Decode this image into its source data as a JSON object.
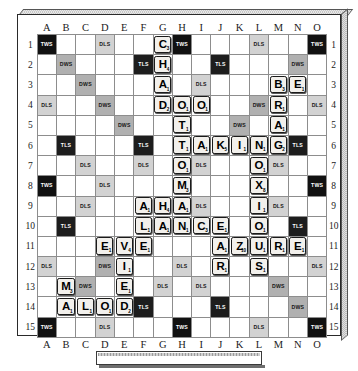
{
  "game": {
    "name": "Scrabble",
    "board_size": 15,
    "column_labels": [
      "A",
      "B",
      "C",
      "D",
      "E",
      "F",
      "G",
      "H",
      "I",
      "J",
      "K",
      "L",
      "M",
      "N",
      "O"
    ],
    "row_labels": [
      "1",
      "2",
      "3",
      "4",
      "5",
      "6",
      "7",
      "8",
      "9",
      "10",
      "11",
      "12",
      "13",
      "14",
      "15"
    ],
    "premium_legend": {
      "tws": "TWS",
      "dws": "DWS",
      "tls": "TLS",
      "dls": "DLS"
    },
    "colors": {
      "triple_word": "#111111",
      "double_word": "#b0b0b0",
      "triple_letter": "#1d1d1d",
      "double_letter": "#d2d2d2",
      "tile_face": "#f2f0ec",
      "board_background": "#ffffff",
      "grid_line": "#8d8d8d"
    }
  },
  "rack": {
    "tiles": [],
    "label": ""
  },
  "premium_squares": [
    {
      "col": "A",
      "row": 1,
      "type": "tws"
    },
    {
      "col": "D",
      "row": 1,
      "type": "dls"
    },
    {
      "col": "H",
      "row": 1,
      "type": "tws"
    },
    {
      "col": "L",
      "row": 1,
      "type": "dls"
    },
    {
      "col": "O",
      "row": 1,
      "type": "tws"
    },
    {
      "col": "B",
      "row": 2,
      "type": "dws"
    },
    {
      "col": "F",
      "row": 2,
      "type": "tls"
    },
    {
      "col": "J",
      "row": 2,
      "type": "tls"
    },
    {
      "col": "N",
      "row": 2,
      "type": "dws"
    },
    {
      "col": "C",
      "row": 3,
      "type": "dws"
    },
    {
      "col": "I",
      "row": 3,
      "type": "dls"
    },
    {
      "col": "A",
      "row": 4,
      "type": "dls"
    },
    {
      "col": "D",
      "row": 4,
      "type": "dws"
    },
    {
      "col": "L",
      "row": 4,
      "type": "dws"
    },
    {
      "col": "O",
      "row": 4,
      "type": "dls"
    },
    {
      "col": "E",
      "row": 5,
      "type": "dws"
    },
    {
      "col": "K",
      "row": 5,
      "type": "dws"
    },
    {
      "col": "B",
      "row": 6,
      "type": "tls"
    },
    {
      "col": "F",
      "row": 6,
      "type": "tls"
    },
    {
      "col": "N",
      "row": 6,
      "type": "tls"
    },
    {
      "col": "C",
      "row": 7,
      "type": "dls"
    },
    {
      "col": "F",
      "row": 7,
      "type": "dls"
    },
    {
      "col": "I",
      "row": 7,
      "type": "dls"
    },
    {
      "col": "M",
      "row": 7,
      "type": "dls"
    },
    {
      "col": "A",
      "row": 8,
      "type": "tws"
    },
    {
      "col": "D",
      "row": 8,
      "type": "dls"
    },
    {
      "col": "O",
      "row": 8,
      "type": "tws"
    },
    {
      "col": "C",
      "row": 9,
      "type": "dls"
    },
    {
      "col": "I",
      "row": 9,
      "type": "dls"
    },
    {
      "col": "M",
      "row": 9,
      "type": "dls"
    },
    {
      "col": "B",
      "row": 10,
      "type": "tls"
    },
    {
      "col": "N",
      "row": 10,
      "type": "tls"
    },
    {
      "col": "A",
      "row": 12,
      "type": "dls"
    },
    {
      "col": "D",
      "row": 12,
      "type": "dws"
    },
    {
      "col": "H",
      "row": 12,
      "type": "dls"
    },
    {
      "col": "O",
      "row": 12,
      "type": "dls"
    },
    {
      "col": "C",
      "row": 13,
      "type": "dws"
    },
    {
      "col": "G",
      "row": 13,
      "type": "dls"
    },
    {
      "col": "I",
      "row": 13,
      "type": "dls"
    },
    {
      "col": "M",
      "row": 13,
      "type": "dws"
    },
    {
      "col": "F",
      "row": 14,
      "type": "tls"
    },
    {
      "col": "J",
      "row": 14,
      "type": "tls"
    },
    {
      "col": "N",
      "row": 14,
      "type": "dws"
    },
    {
      "col": "A",
      "row": 15,
      "type": "tws"
    },
    {
      "col": "D",
      "row": 15,
      "type": "dls"
    },
    {
      "col": "H",
      "row": 15,
      "type": "tws"
    },
    {
      "col": "L",
      "row": 15,
      "type": "dls"
    },
    {
      "col": "O",
      "row": 15,
      "type": "tws"
    }
  ],
  "tiles": [
    {
      "col": "G",
      "row": 1,
      "letter": "C",
      "value": 3
    },
    {
      "col": "G",
      "row": 2,
      "letter": "H",
      "value": 4
    },
    {
      "col": "G",
      "row": 3,
      "letter": "A",
      "value": 1
    },
    {
      "col": "M",
      "row": 3,
      "letter": "B",
      "value": 3
    },
    {
      "col": "N",
      "row": 3,
      "letter": "E",
      "value": 1
    },
    {
      "col": "G",
      "row": 4,
      "letter": "D",
      "value": 2
    },
    {
      "col": "H",
      "row": 4,
      "letter": "O",
      "value": 1
    },
    {
      "col": "I",
      "row": 4,
      "letter": "O",
      "value": 1
    },
    {
      "col": "M",
      "row": 4,
      "letter": "R",
      "value": 1
    },
    {
      "col": "H",
      "row": 5,
      "letter": "T",
      "value": 1
    },
    {
      "col": "M",
      "row": 5,
      "letter": "A",
      "value": 1
    },
    {
      "col": "H",
      "row": 6,
      "letter": "T",
      "value": 1
    },
    {
      "col": "I",
      "row": 6,
      "letter": "A",
      "value": 1
    },
    {
      "col": "J",
      "row": 6,
      "letter": "K",
      "value": 5
    },
    {
      "col": "K",
      "row": 6,
      "letter": "I",
      "value": 1
    },
    {
      "col": "L",
      "row": 6,
      "letter": "N",
      "value": 1
    },
    {
      "col": "M",
      "row": 6,
      "letter": "G",
      "value": 2
    },
    {
      "col": "H",
      "row": 7,
      "letter": "O",
      "value": 1
    },
    {
      "col": "L",
      "row": 7,
      "letter": "O",
      "value": 1
    },
    {
      "col": "H",
      "row": 8,
      "letter": "M",
      "value": 3
    },
    {
      "col": "L",
      "row": 8,
      "letter": "X",
      "value": 8
    },
    {
      "col": "F",
      "row": 9,
      "letter": "A",
      "value": 1
    },
    {
      "col": "G",
      "row": 9,
      "letter": "H",
      "value": 4
    },
    {
      "col": "H",
      "row": 9,
      "letter": "A",
      "value": 1
    },
    {
      "col": "L",
      "row": 9,
      "letter": "I",
      "value": 1
    },
    {
      "col": "F",
      "row": 10,
      "letter": "L",
      "value": 1
    },
    {
      "col": "G",
      "row": 10,
      "letter": "A",
      "value": 1
    },
    {
      "col": "H",
      "row": 10,
      "letter": "N",
      "value": 1
    },
    {
      "col": "I",
      "row": 10,
      "letter": "C",
      "value": 3
    },
    {
      "col": "J",
      "row": 10,
      "letter": "E",
      "value": 1
    },
    {
      "col": "L",
      "row": 10,
      "letter": "O",
      "value": 1
    },
    {
      "col": "D",
      "row": 11,
      "letter": "E",
      "value": 1
    },
    {
      "col": "E",
      "row": 11,
      "letter": "V",
      "value": 4
    },
    {
      "col": "F",
      "row": 11,
      "letter": "E",
      "value": 1
    },
    {
      "col": "J",
      "row": 11,
      "letter": "A",
      "value": 1
    },
    {
      "col": "K",
      "row": 11,
      "letter": "Z",
      "value": 10
    },
    {
      "col": "L",
      "row": 11,
      "letter": "U",
      "value": 1
    },
    {
      "col": "M",
      "row": 11,
      "letter": "R",
      "value": 1
    },
    {
      "col": "N",
      "row": 11,
      "letter": "E",
      "value": 1
    },
    {
      "col": "E",
      "row": 12,
      "letter": "I",
      "value": 1
    },
    {
      "col": "J",
      "row": 12,
      "letter": "R",
      "value": 1
    },
    {
      "col": "L",
      "row": 12,
      "letter": "S",
      "value": 1
    },
    {
      "col": "B",
      "row": 13,
      "letter": "M",
      "value": 3
    },
    {
      "col": "E",
      "row": 13,
      "letter": "E",
      "value": 1
    },
    {
      "col": "B",
      "row": 14,
      "letter": "A",
      "value": 1
    },
    {
      "col": "C",
      "row": 14,
      "letter": "L",
      "value": 1
    },
    {
      "col": "D",
      "row": 14,
      "letter": "O",
      "value": 1
    },
    {
      "col": "E",
      "row": 14,
      "letter": "D",
      "value": 2
    }
  ]
}
